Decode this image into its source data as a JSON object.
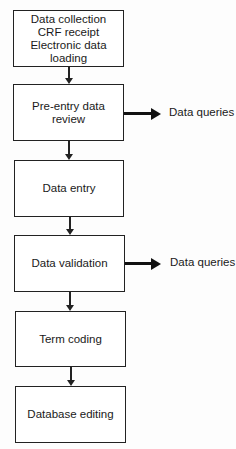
{
  "header_fragment": "...",
  "steps": [
    {
      "lines": [
        "Data collection",
        "CRF receipt",
        "Electronic data",
        "loading"
      ]
    },
    {
      "lines": [
        "Pre-entry data",
        "review"
      ],
      "output": "Data queries"
    },
    {
      "lines": [
        "Data entry"
      ]
    },
    {
      "lines": [
        "Data validation"
      ],
      "output": "Data queries"
    },
    {
      "lines": [
        "Term coding"
      ]
    },
    {
      "lines": [
        "Database editing"
      ]
    }
  ]
}
